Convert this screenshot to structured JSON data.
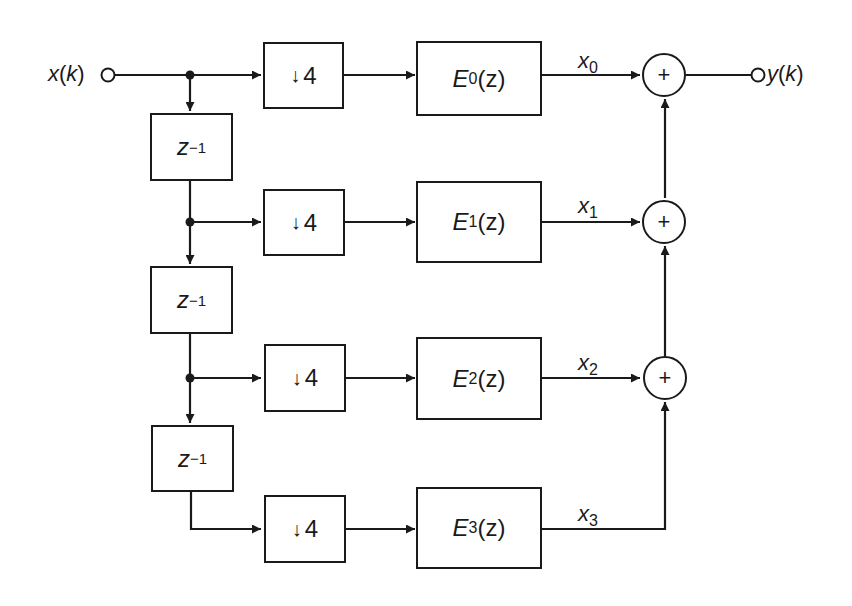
{
  "diagram": {
    "type": "polyphase decimation filter block diagram",
    "input": {
      "var": "x",
      "arg": "(",
      "argvar": "k",
      "close": ")"
    },
    "output": {
      "var": "y",
      "arg": "(",
      "argvar": "k",
      "close": ")"
    },
    "delay": {
      "base": "z",
      "exp": "−1"
    },
    "downsampler": {
      "symbol": "↓",
      "factor": "4"
    },
    "branches": [
      {
        "index": "0",
        "filter": {
          "name": "E",
          "sub": "0",
          "arg": "(z)"
        },
        "signal": {
          "name": "x",
          "sub": "0"
        }
      },
      {
        "index": "1",
        "filter": {
          "name": "E",
          "sub": "1",
          "arg": "(z)"
        },
        "signal": {
          "name": "x",
          "sub": "1"
        }
      },
      {
        "index": "2",
        "filter": {
          "name": "E",
          "sub": "2",
          "arg": "(z)"
        },
        "signal": {
          "name": "x",
          "sub": "2"
        }
      },
      {
        "index": "3",
        "filter": {
          "name": "E",
          "sub": "3",
          "arg": "(z)"
        },
        "signal": {
          "name": "x",
          "sub": "3"
        }
      }
    ],
    "adder_symbol": "+",
    "colors": {
      "stroke": "#1a1a1a",
      "background": "#ffffff"
    }
  }
}
